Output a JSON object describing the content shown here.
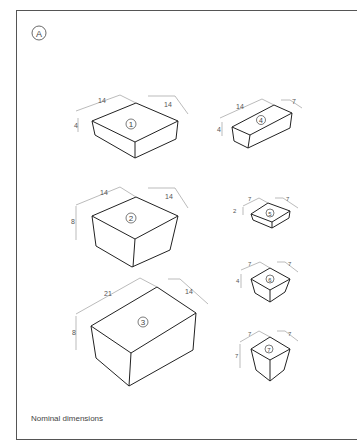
{
  "figure": {
    "label": "A",
    "caption": "Nominal dimensions"
  },
  "boxes": [
    {
      "id": "1",
      "length": "14",
      "width": "14",
      "height": "4"
    },
    {
      "id": "2",
      "length": "14",
      "width": "14",
      "height": "8"
    },
    {
      "id": "3",
      "length": "21",
      "width": "14",
      "height": "8"
    },
    {
      "id": "4",
      "length": "14",
      "width": "7",
      "height": "4"
    },
    {
      "id": "5",
      "length": "7",
      "width": "7",
      "height": "2"
    },
    {
      "id": "6",
      "length": "7",
      "width": "7",
      "height": "4"
    },
    {
      "id": "7",
      "length": "7",
      "width": "7",
      "height": "7"
    }
  ]
}
